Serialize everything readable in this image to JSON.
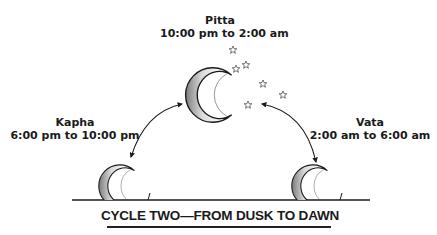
{
  "diagram": {
    "title": "CYCLE TWO—FROM DUSK TO DAWN",
    "phases": [
      {
        "name": "Kapha",
        "time": "6:00 pm to 10:00 pm",
        "position": "left"
      },
      {
        "name": "Pitta",
        "time": "10:00 pm to 2:00 am",
        "position": "top"
      },
      {
        "name": "Vata",
        "time": "2:00 am to 6:00 am",
        "position": "right"
      }
    ],
    "icons": {
      "moon": "crescent-moon",
      "star": "star-outline",
      "arrow": "double-headed-curved-arrow"
    },
    "colors": {
      "ink": "#1a1a1a",
      "moon_light": "#f2f2f2",
      "moon_dark": "#8c8c8c",
      "background": "#ffffff"
    }
  }
}
